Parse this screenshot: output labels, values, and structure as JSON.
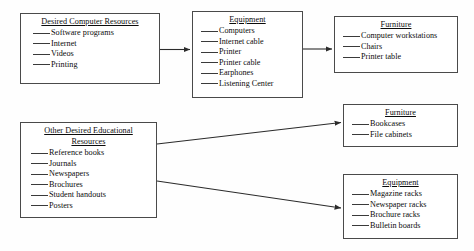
{
  "diagram": {
    "boxes": [
      {
        "id": "computer_resources",
        "title": "Desired Computer Resources",
        "items": [
          "Software programs",
          "Internet",
          "Videos",
          "Printing"
        ]
      },
      {
        "id": "equipment_top",
        "title": "Equipment",
        "items": [
          "Computers",
          "Internet cable",
          "Printer",
          "Printer cable",
          "Earphones",
          "Listening Center"
        ]
      },
      {
        "id": "furniture_top",
        "title": "Furniture",
        "items": [
          "Computer workstations",
          "Chairs",
          "Printer table"
        ]
      },
      {
        "id": "other_resources",
        "title_line1": "Other Desired Educational",
        "title_line2": "Resources",
        "items": [
          "Reference books",
          "Journals",
          "Newspapers",
          "Brochures",
          "Student handouts",
          "Posters"
        ]
      },
      {
        "id": "furniture_mid",
        "title": "Furniture",
        "items": [
          "Bookcases",
          "File cabinets"
        ]
      },
      {
        "id": "equipment_bottom",
        "title": "Equipment",
        "items": [
          "Magazine racks",
          "Newspaper racks",
          "Brochure racks",
          "Bulletin boards"
        ]
      }
    ],
    "connectors": [
      {
        "id": "computer-to-equipment",
        "from": "computer_resources",
        "to": "equipment_top"
      },
      {
        "id": "equipment-to-furniture",
        "from": "equipment_top",
        "to": "furniture_top"
      },
      {
        "id": "other-to-furniture",
        "from": "other_resources",
        "to": "furniture_mid"
      },
      {
        "id": "other-to-equipment",
        "from": "other_resources",
        "to": "equipment_bottom"
      }
    ],
    "colors": {
      "line": "#3a3a3a",
      "box_border": "#4a4a4a",
      "text": "#0b0b0b",
      "background": "#fefefe"
    }
  }
}
